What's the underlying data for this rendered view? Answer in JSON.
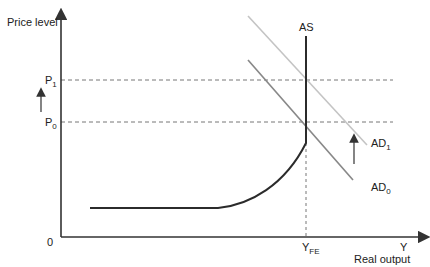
{
  "diagram": {
    "type": "AD-AS diagram",
    "y_axis_label": "Price level",
    "x_axis_label": "Real output",
    "x_axis_end": "Y",
    "origin": "0",
    "price_levels": [
      {
        "label": "P",
        "subscript": "1"
      },
      {
        "label": "P",
        "subscript": "0"
      }
    ],
    "full_employment": {
      "label": "Y",
      "subscript": "FE"
    },
    "curves": {
      "as": {
        "label": "AS"
      },
      "ad0": {
        "label": "AD",
        "subscript": "0"
      },
      "ad1": {
        "label": "AD",
        "subscript": "1"
      }
    },
    "colors": {
      "axis": "#333333",
      "as_curve": "#2b2b2b",
      "ad0": "#888888",
      "ad1": "#c4c4c4",
      "dashed": "#777777"
    }
  }
}
